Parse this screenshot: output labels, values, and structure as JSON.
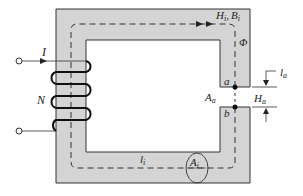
{
  "diagram": {
    "type": "magnetic-circuit",
    "core_color": "#d4d4d4",
    "line_color": "#1a1a1a",
    "labels": {
      "current": "I",
      "turns": "N",
      "field_iron": "H",
      "field_iron_sub": "i",
      "comma": ",",
      "flux_density_iron": "B",
      "flux_density_iron_sub": "i",
      "flux": "Φ",
      "point_a": "a",
      "point_b": "b",
      "gap_area": "A",
      "gap_area_sub": "a",
      "gap_field": "H",
      "gap_field_sub": "a",
      "gap_length": "l",
      "gap_length_sub": "a",
      "iron_length": "l",
      "iron_length_sub": "i",
      "iron_area": "A",
      "iron_area_sub": "i"
    }
  }
}
